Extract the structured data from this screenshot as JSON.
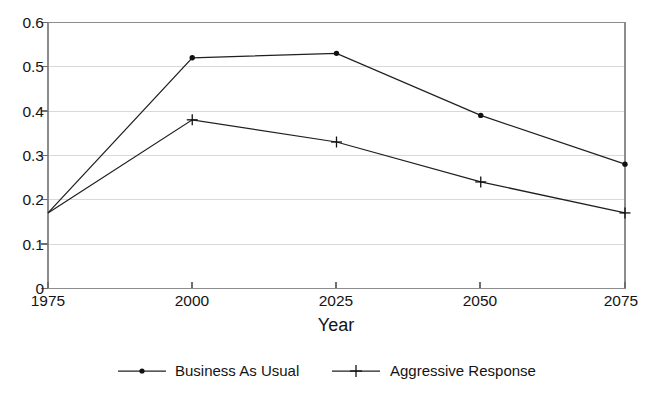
{
  "chart_data": {
    "type": "line",
    "title": "",
    "subtitle": "",
    "xlabel": "Year",
    "ylabel": "",
    "x": [
      1975,
      2000,
      2025,
      2050,
      2075
    ],
    "categories": [
      "1975",
      "2000",
      "2025",
      "2050",
      "2075"
    ],
    "series": [
      {
        "name": "Business As Usual",
        "marker": "dot",
        "values": [
          0.17,
          0.52,
          0.53,
          0.39,
          0.28
        ]
      },
      {
        "name": "Aggressive Response",
        "marker": "plus",
        "values": [
          0.17,
          0.38,
          0.33,
          0.24,
          0.17
        ]
      }
    ],
    "xlim": [
      1975,
      2075
    ],
    "ylim": [
      0,
      0.6
    ],
    "ytick_labels": [
      "0.6",
      "0.5",
      "0.4",
      "0.3",
      "0.2",
      "0.1",
      "0"
    ],
    "ytick_values": [
      0.6,
      0.5,
      0.4,
      0.3,
      0.2,
      0.1,
      0
    ],
    "xtick_labels": [
      "1975",
      "2000",
      "2025",
      "2050",
      "2075"
    ],
    "grid": true,
    "grid_axis": "y",
    "legend_position": "bottom",
    "line_color": "#202020",
    "grid_color": "#d9d9d9",
    "frame_color": "#8c8c8c",
    "background_color": "#ffffff"
  },
  "legend": {
    "entries": [
      {
        "label": "Business As Usual",
        "marker": "dot"
      },
      {
        "label": "Aggressive Response",
        "marker": "plus"
      }
    ]
  },
  "axes": {
    "x_title": "Year",
    "y_ticks": [
      {
        "label": "0.6"
      },
      {
        "label": "0.5"
      },
      {
        "label": "0.4"
      },
      {
        "label": "0.3"
      },
      {
        "label": "0.2"
      },
      {
        "label": "0.1"
      },
      {
        "label": "0"
      }
    ],
    "x_ticks": [
      {
        "label": "1975"
      },
      {
        "label": "2000"
      },
      {
        "label": "2025"
      },
      {
        "label": "2050"
      },
      {
        "label": "2075"
      }
    ]
  }
}
